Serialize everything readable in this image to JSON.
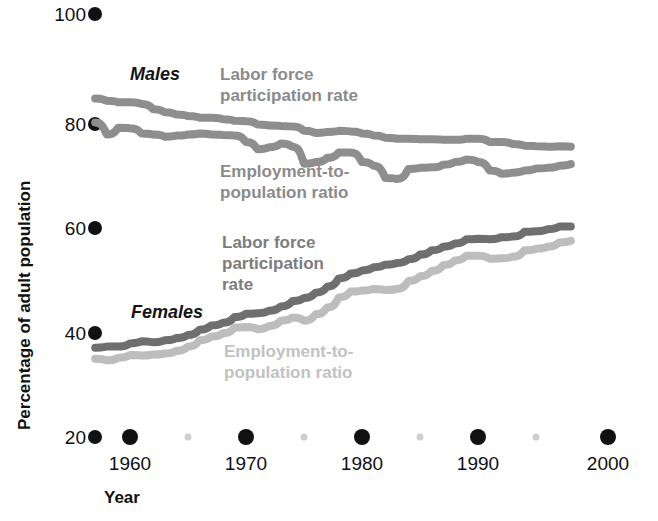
{
  "chart_data": {
    "type": "line",
    "title": "",
    "xlabel": "Year",
    "ylabel": "Percentage of adult population",
    "xlim": [
      1956,
      1999
    ],
    "ylim": [
      20,
      100
    ],
    "grid": false,
    "legend_position": "inline-annotations",
    "x_ticks_major": [
      1960,
      1970,
      1980,
      1990,
      2000
    ],
    "x_ticks_minor": [
      1965,
      1975,
      1985,
      1995
    ],
    "y_ticks": [
      20,
      40,
      60,
      80,
      100
    ],
    "colors": {
      "males_lfp": "#8e8e8e",
      "males_epr": "#8e8e8e",
      "females_lfp": "#6f6f6f",
      "females_epr": "#bdbdbd",
      "axis": "#111111"
    },
    "x": [
      1957,
      1958,
      1959,
      1960,
      1961,
      1962,
      1963,
      1964,
      1965,
      1966,
      1967,
      1968,
      1969,
      1970,
      1971,
      1972,
      1973,
      1974,
      1975,
      1976,
      1977,
      1978,
      1979,
      1980,
      1981,
      1982,
      1983,
      1984,
      1985,
      1986,
      1987,
      1988,
      1989,
      1990,
      1991,
      1992,
      1993,
      1994,
      1995,
      1996,
      1997,
      1998
    ],
    "series": [
      {
        "name": "Males — Labor force participation rate",
        "group": "Males",
        "measure": "Labor force participation rate",
        "color": "#8e8e8e",
        "values": [
          84.0,
          83.6,
          83.3,
          83.3,
          83.0,
          82.0,
          81.4,
          81.0,
          80.7,
          80.4,
          80.4,
          80.1,
          79.8,
          79.7,
          79.1,
          78.9,
          78.8,
          78.7,
          77.9,
          77.5,
          77.7,
          77.9,
          77.8,
          77.4,
          77.0,
          76.6,
          76.4,
          76.4,
          76.3,
          76.3,
          76.2,
          76.2,
          76.4,
          76.4,
          75.8,
          75.8,
          75.4,
          75.1,
          75.0,
          74.9,
          75.0,
          74.9
        ]
      },
      {
        "name": "Males — Employment-to-population ratio",
        "group": "Males",
        "measure": "Employment-to-population ratio",
        "color": "#8e8e8e",
        "values": [
          79.5,
          77.2,
          78.5,
          78.4,
          77.4,
          77.2,
          76.8,
          77.0,
          77.2,
          77.4,
          77.2,
          77.1,
          77.0,
          75.8,
          74.4,
          74.8,
          75.5,
          74.9,
          71.7,
          72.0,
          72.8,
          73.8,
          73.8,
          72.0,
          71.3,
          69.0,
          68.8,
          70.7,
          70.9,
          71.0,
          71.5,
          72.0,
          72.5,
          72.0,
          70.4,
          69.8,
          70.0,
          70.4,
          70.8,
          70.9,
          71.3,
          71.6
        ]
      },
      {
        "name": "Females — Labor force participation rate",
        "group": "Females",
        "measure": "Labor force participation rate",
        "color": "#6f6f6f",
        "values": [
          36.9,
          37.1,
          37.1,
          37.7,
          38.1,
          37.9,
          38.3,
          38.7,
          39.3,
          40.3,
          41.1,
          41.6,
          42.7,
          43.3,
          43.4,
          43.9,
          44.7,
          45.7,
          46.3,
          47.3,
          48.4,
          50.0,
          50.9,
          51.5,
          52.1,
          52.6,
          52.9,
          53.6,
          54.5,
          55.3,
          56.0,
          56.6,
          57.4,
          57.5,
          57.4,
          57.8,
          57.9,
          58.8,
          58.9,
          59.3,
          59.8,
          59.8
        ]
      },
      {
        "name": "Females — Employment-to-population ratio",
        "group": "Females",
        "measure": "Employment-to-population ratio",
        "color": "#bdbdbd",
        "values": [
          34.8,
          34.5,
          35.0,
          35.5,
          35.4,
          35.6,
          35.8,
          36.3,
          37.1,
          38.3,
          39.0,
          39.6,
          40.7,
          40.8,
          40.4,
          41.0,
          42.0,
          42.6,
          42.0,
          43.2,
          44.5,
          46.4,
          47.5,
          47.7,
          48.0,
          47.8,
          48.0,
          49.5,
          50.4,
          51.4,
          52.5,
          53.4,
          54.3,
          54.3,
          53.7,
          53.8,
          54.1,
          55.3,
          55.6,
          56.0,
          56.8,
          57.1
        ]
      }
    ],
    "annotations": [
      {
        "id": "males-group",
        "text": "Males",
        "style": "bold-italic-black",
        "x": 130,
        "y": 80
      },
      {
        "id": "males-lfp-line1",
        "text": "Labor force",
        "style": "bold-gray",
        "x": 220,
        "y": 80
      },
      {
        "id": "males-lfp-line2",
        "text": "participation rate",
        "style": "bold-gray",
        "x": 220,
        "y": 101
      },
      {
        "id": "males-epr-line1",
        "text": "Employment-to-",
        "style": "bold-gray",
        "x": 220,
        "y": 177
      },
      {
        "id": "males-epr-line2",
        "text": "population ratio",
        "style": "bold-gray",
        "x": 220,
        "y": 198
      },
      {
        "id": "females-lfp-line1",
        "text": "Labor force",
        "style": "bold-gray-dark",
        "x": 222,
        "y": 248
      },
      {
        "id": "females-lfp-line2",
        "text": "participation",
        "style": "bold-gray-dark",
        "x": 222,
        "y": 269
      },
      {
        "id": "females-lfp-line3",
        "text": "rate",
        "style": "bold-gray-dark",
        "x": 222,
        "y": 290
      },
      {
        "id": "females-group",
        "text": "Females",
        "style": "bold-italic-black",
        "x": 131,
        "y": 318
      },
      {
        "id": "females-epr-line1",
        "text": "Employment-to-",
        "style": "bold-gray-light",
        "x": 224,
        "y": 357
      },
      {
        "id": "females-epr-line2",
        "text": "population ratio",
        "style": "bold-gray-light",
        "x": 224,
        "y": 378
      }
    ]
  },
  "axes": {
    "y_label": "Percentage of adult population",
    "x_label": "Year",
    "y_tick_labels": [
      "100",
      "80",
      "60",
      "40",
      "20"
    ],
    "x_tick_labels": [
      "1960",
      "1970",
      "1980",
      "1990",
      "2000"
    ]
  }
}
